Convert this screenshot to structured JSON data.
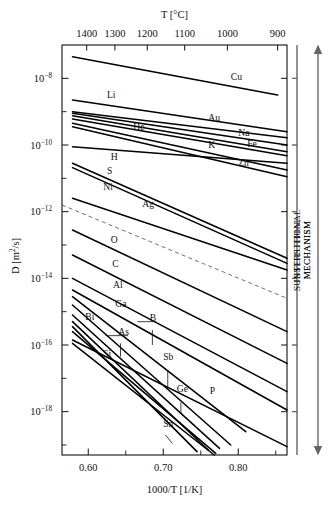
{
  "chart_data": {
    "type": "line",
    "title": "",
    "xlabel": "1000/T [1/K]",
    "ylabel": "D [m2/s]",
    "ylabel_display": "D [m",
    "ylabel_sup": "2",
    "ylabel_tail": "/s]",
    "top_axis_label": "T [°C]",
    "xlim": [
      0.565,
      0.865
    ],
    "ylim_log10": [
      -19.3,
      -7.0
    ],
    "grid": false,
    "legend": "inline-labels",
    "x_ticks": [
      {
        "value": 0.6,
        "label": "0.60"
      },
      {
        "value": 0.65,
        "label": ""
      },
      {
        "value": 0.7,
        "label": "0.70"
      },
      {
        "value": 0.75,
        "label": ""
      },
      {
        "value": 0.8,
        "label": "0.80"
      },
      {
        "value": 0.85,
        "label": ""
      }
    ],
    "y_ticks": [
      {
        "exp": -8,
        "label": "10",
        "sup": "−8"
      },
      {
        "exp": -9,
        "label": "",
        "sup": ""
      },
      {
        "exp": -10,
        "label": "10",
        "sup": "−10"
      },
      {
        "exp": -11,
        "label": "",
        "sup": ""
      },
      {
        "exp": -12,
        "label": "10",
        "sup": "−12"
      },
      {
        "exp": -13,
        "label": "",
        "sup": ""
      },
      {
        "exp": -14,
        "label": "10",
        "sup": "−14"
      },
      {
        "exp": -15,
        "label": "",
        "sup": ""
      },
      {
        "exp": -16,
        "label": "10",
        "sup": "−16"
      },
      {
        "exp": -17,
        "label": "",
        "sup": ""
      },
      {
        "exp": -18,
        "label": "10",
        "sup": "−18"
      },
      {
        "exp": -19,
        "label": "",
        "sup": ""
      }
    ],
    "top_ticks": [
      {
        "temp_c": 1400,
        "x": 0.5979,
        "label": "1400"
      },
      {
        "temp_c": 1300,
        "x": 0.6356,
        "label": "1300"
      },
      {
        "temp_c": 1200,
        "x": 0.6787,
        "label": "1200"
      },
      {
        "temp_c": 1100,
        "x": 0.7286,
        "label": "1100"
      },
      {
        "temp_c": 1000,
        "x": 0.7855,
        "label": "1000"
      },
      {
        "temp_c": 900,
        "x": 0.8525,
        "label": "900"
      }
    ],
    "series": [
      {
        "name": "Cu",
        "label_side": "right",
        "x": [
          0.579,
          0.8525
        ],
        "y_log10": [
          -7.35,
          -8.5
        ]
      },
      {
        "name": "Li",
        "label_side": "left",
        "x": [
          0.579,
          0.865
        ],
        "y_log10": [
          -8.65,
          -9.6
        ]
      },
      {
        "name": "Au",
        "label_side": "right",
        "x": [
          0.579,
          0.865
        ],
        "y_log10": [
          -9.0,
          -9.78
        ]
      },
      {
        "name": "Na",
        "label_side": "right",
        "x": [
          0.579,
          0.865
        ],
        "y_log10": [
          -9.05,
          -10.0
        ]
      },
      {
        "name": "Fe",
        "label_side": "right",
        "x": [
          0.579,
          0.865
        ],
        "y_log10": [
          -9.12,
          -10.2
        ]
      },
      {
        "name": "He",
        "label_side": "left",
        "x": [
          0.579,
          0.865
        ],
        "y_log10": [
          -9.22,
          -10.32
        ]
      },
      {
        "name": "K",
        "label_side": "right",
        "x": [
          0.579,
          0.865
        ],
        "y_log10": [
          -9.35,
          -10.75
        ]
      },
      {
        "name": "Zn",
        "label_side": "right",
        "x": [
          0.579,
          0.865
        ],
        "y_log10": [
          -9.45,
          -10.95
        ]
      },
      {
        "name": "H",
        "label_side": "left",
        "x": [
          0.579,
          0.865
        ],
        "y_log10": [
          -10.05,
          -10.55
        ]
      },
      {
        "name": "S",
        "label_side": "left",
        "x": [
          0.579,
          0.865
        ],
        "y_log10": [
          -10.55,
          -13.4
        ]
      },
      {
        "name": "Ni",
        "label_side": "left",
        "x": [
          0.579,
          0.865
        ],
        "y_log10": [
          -10.68,
          -13.55
        ]
      },
      {
        "name": "Ag",
        "label_side": "left",
        "x": [
          0.579,
          0.865
        ],
        "y_log10": [
          -11.6,
          -13.75
        ]
      },
      {
        "name": "O",
        "label_side": "left",
        "x": [
          0.579,
          0.865
        ],
        "y_log10": [
          -12.55,
          -15.6
        ]
      },
      {
        "name": "C",
        "label_side": "left",
        "x": [
          0.579,
          0.865
        ],
        "y_log10": [
          -13.3,
          -16.55
        ]
      },
      {
        "name": "Al",
        "label_side": "left",
        "x": [
          0.579,
          0.865
        ],
        "y_log10": [
          -14.0,
          -17.4
        ]
      },
      {
        "name": "Ga",
        "label_side": "left",
        "x": [
          0.579,
          0.865
        ],
        "y_log10": [
          -14.35,
          -17.95
        ]
      },
      {
        "name": "Bi",
        "label_side": "left",
        "x": [
          0.579,
          0.81
        ],
        "y_log10": [
          -14.55,
          -18.6
        ]
      },
      {
        "name": "B",
        "label_side": "mid",
        "x": [
          0.579,
          0.79
        ],
        "y_log10": [
          -14.8,
          -19.0
        ]
      },
      {
        "name": "As",
        "label_side": "left",
        "x": [
          0.579,
          0.775
        ],
        "y_log10": [
          -15.1,
          -19.1
        ]
      },
      {
        "name": "Sb",
        "label_side": "mid",
        "x": [
          0.579,
          0.76
        ],
        "y_log10": [
          -15.3,
          -19.15
        ]
      },
      {
        "name": "Si",
        "label_side": "left",
        "x": [
          0.579,
          0.745
        ],
        "y_log10": [
          -15.45,
          -19.2
        ]
      },
      {
        "name": "Ge",
        "label_side": "mid",
        "x": [
          0.579,
          0.77
        ],
        "y_log10": [
          -15.6,
          -19.25
        ]
      },
      {
        "name": "P",
        "label_side": "mid",
        "x": [
          0.579,
          0.865
        ],
        "y_log10": [
          -15.85,
          -19.05
        ]
      },
      {
        "name": "Sn",
        "label_side": "mid",
        "x": [
          0.579,
          0.768
        ],
        "y_log10": [
          -15.95,
          -19.3
        ]
      }
    ],
    "divider": {
      "name": "mechanism-divider",
      "style": "dashed",
      "x": [
        0.565,
        0.865
      ],
      "y_log10": [
        -11.8,
        -14.6
      ]
    },
    "annotations": [
      {
        "name": "interstitial-mechanism",
        "text_line1": "INTERSTITIAL",
        "text_line2": "MECHANISM",
        "span_top_y_log10": -7.0,
        "span_bottom_y_log10": -13.55
      },
      {
        "name": "substitutional-mechanism",
        "text_line1": "SUBSTITUTIONAL",
        "text_line2": "MECHANISM",
        "span_top_y_log10": -14.25,
        "span_bottom_y_log10": -19.3
      }
    ]
  }
}
